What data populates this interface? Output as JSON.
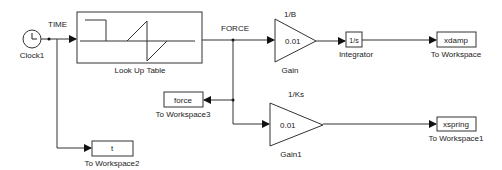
{
  "blocks": {
    "clock": {
      "name": "Clock1"
    },
    "lookup": {
      "name": "Look Up Table"
    },
    "gain": {
      "name": "Gain",
      "value": "0.01",
      "param": "1/B"
    },
    "integrator": {
      "name": "Integrator",
      "value": "1/s"
    },
    "to_workspace": {
      "name": "To Workspace",
      "var": "xdamp"
    },
    "gain1": {
      "name": "Gain1",
      "value": "0.01",
      "param": "1/Ks"
    },
    "to_workspace1": {
      "name": "To Workspace1",
      "var": "xspring"
    },
    "to_workspace3": {
      "name": "To Workspace3",
      "var": "force"
    },
    "to_workspace2": {
      "name": "To Workspace2",
      "var": "t"
    }
  },
  "signals": {
    "time": "TIME",
    "force": "FORCE"
  }
}
